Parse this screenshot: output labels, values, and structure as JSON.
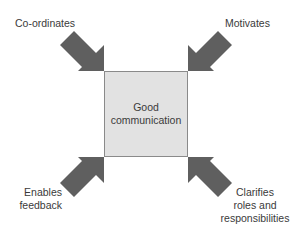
{
  "diagram": {
    "center": {
      "line1": "Good",
      "line2": "communication"
    },
    "labels": {
      "top_left": "Co-ordinates",
      "top_right": "Motivates",
      "bottom_left": {
        "line1": "Enables",
        "line2": "feedback"
      },
      "bottom_right": {
        "line1": "Clarifies",
        "line2": "roles and",
        "line3": "responsibilities"
      }
    },
    "colors": {
      "box_fill": "#e2e2e2",
      "box_border": "#8a8a8a",
      "arrow": "#5f5f5f",
      "text": "#3a3a3a"
    }
  }
}
